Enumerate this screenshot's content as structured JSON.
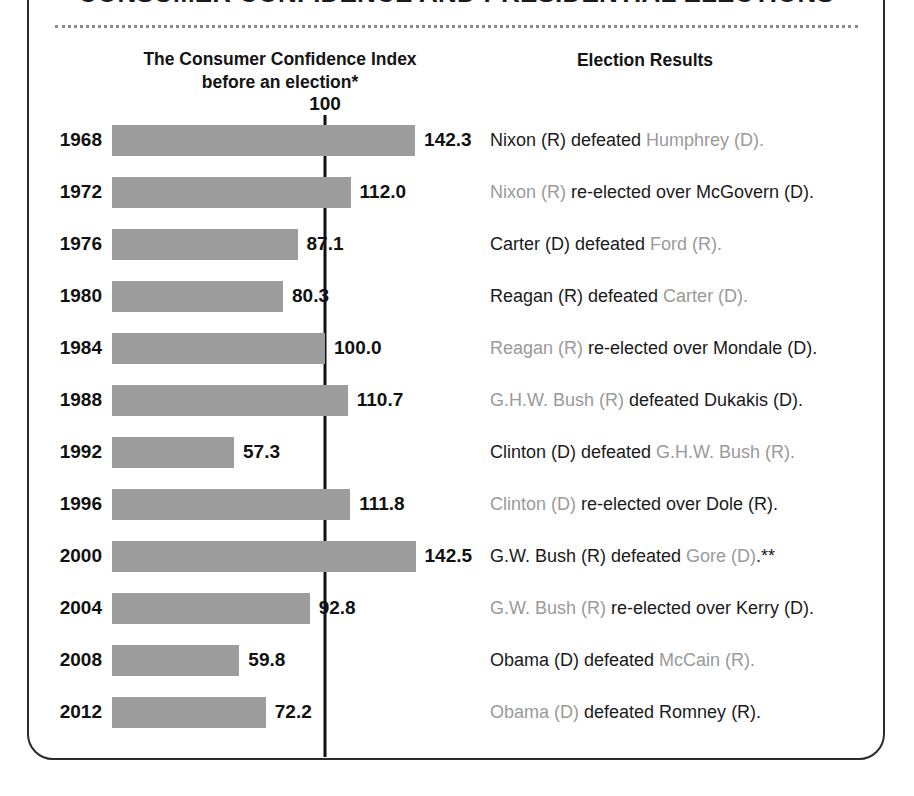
{
  "title": "CONSUMER CONFIDENCE AND PRESIDENTIAL ELECTIONS",
  "headers": {
    "left_line1": "The Consumer Confidence Index",
    "left_line2": "before an election*",
    "right": "Election Results"
  },
  "reference": {
    "label": "100",
    "value": 100
  },
  "colors": {
    "bar": "#9d9d9d",
    "text": "#1a1a1a",
    "dim_text": "#9a9a9a",
    "rule": "#111111",
    "panel_border": "#2b2b2b"
  },
  "chart_data": {
    "type": "bar",
    "title": "CONSUMER CONFIDENCE AND PRESIDENTIAL ELECTIONS",
    "xlabel": "The Consumer Confidence Index before an election*",
    "ylabel": "",
    "orientation": "horizontal",
    "grid": false,
    "legend": "none",
    "xlim": [
      0,
      150
    ],
    "reference_line": 100,
    "categories": [
      "1968",
      "1972",
      "1976",
      "1980",
      "1984",
      "1988",
      "1992",
      "1996",
      "2000",
      "2004",
      "2008",
      "2012"
    ],
    "values": [
      142.3,
      112.0,
      87.1,
      80.3,
      100.0,
      110.7,
      57.3,
      111.8,
      142.5,
      92.8,
      59.8,
      72.2
    ],
    "value_labels": [
      "142.3",
      "112.0",
      "87.1",
      "80.3",
      "100.0",
      "110.7",
      "57.3",
      "111.8",
      "142.5",
      "92.8",
      "59.8",
      "72.2"
    ]
  },
  "rows": [
    {
      "year": "1968",
      "value": 142.3,
      "value_label": "142.3",
      "result_parts": [
        {
          "text": "Nixon (R) defeated ",
          "emphasis": "strong"
        },
        {
          "text": "Humphrey (D).",
          "emphasis": "dim"
        }
      ]
    },
    {
      "year": "1972",
      "value": 112.0,
      "value_label": "112.0",
      "result_parts": [
        {
          "text": "Nixon (R) ",
          "emphasis": "dim"
        },
        {
          "text": "re-elected over McGovern (D).",
          "emphasis": "strong"
        }
      ]
    },
    {
      "year": "1976",
      "value": 87.1,
      "value_label": "87.1",
      "result_parts": [
        {
          "text": "Carter (D) defeated ",
          "emphasis": "strong"
        },
        {
          "text": "Ford (R).",
          "emphasis": "dim"
        }
      ]
    },
    {
      "year": "1980",
      "value": 80.3,
      "value_label": "80.3",
      "result_parts": [
        {
          "text": "Reagan (R) defeated ",
          "emphasis": "strong"
        },
        {
          "text": "Carter (D).",
          "emphasis": "dim"
        }
      ]
    },
    {
      "year": "1984",
      "value": 100.0,
      "value_label": "100.0",
      "result_parts": [
        {
          "text": "Reagan (R) ",
          "emphasis": "dim"
        },
        {
          "text": "re-elected over Mondale (D).",
          "emphasis": "strong"
        }
      ]
    },
    {
      "year": "1988",
      "value": 110.7,
      "value_label": "110.7",
      "result_parts": [
        {
          "text": "G.H.W. Bush (R) ",
          "emphasis": "dim"
        },
        {
          "text": "defeated Dukakis (D).",
          "emphasis": "strong"
        }
      ]
    },
    {
      "year": "1992",
      "value": 57.3,
      "value_label": "57.3",
      "result_parts": [
        {
          "text": "Clinton (D) defeated ",
          "emphasis": "strong"
        },
        {
          "text": "G.H.W. Bush (R).",
          "emphasis": "dim"
        }
      ]
    },
    {
      "year": "1996",
      "value": 111.8,
      "value_label": "111.8",
      "result_parts": [
        {
          "text": "Clinton (D) ",
          "emphasis": "dim"
        },
        {
          "text": "re-elected over Dole (R).",
          "emphasis": "strong"
        }
      ]
    },
    {
      "year": "2000",
      "value": 142.5,
      "value_label": "142.5",
      "result_parts": [
        {
          "text": "G.W. Bush (R) defeated ",
          "emphasis": "strong"
        },
        {
          "text": "Gore (D)",
          "emphasis": "dim"
        },
        {
          "text": ".**",
          "emphasis": "strong"
        }
      ]
    },
    {
      "year": "2004",
      "value": 92.8,
      "value_label": "92.8",
      "result_parts": [
        {
          "text": "G.W. Bush (R) ",
          "emphasis": "dim"
        },
        {
          "text": "re-elected over Kerry (D).",
          "emphasis": "strong"
        }
      ]
    },
    {
      "year": "2008",
      "value": 59.8,
      "value_label": "59.8",
      "result_parts": [
        {
          "text": "Obama (D) defeated ",
          "emphasis": "strong"
        },
        {
          "text": "McCain (R).",
          "emphasis": "dim"
        }
      ]
    },
    {
      "year": "2012",
      "value": 72.2,
      "value_label": "72.2",
      "result_parts": [
        {
          "text": "Obama (D) ",
          "emphasis": "dim"
        },
        {
          "text": "defeated Romney (R).",
          "emphasis": "strong"
        }
      ]
    }
  ]
}
